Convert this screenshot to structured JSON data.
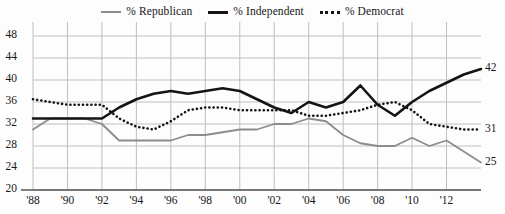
{
  "legend": {
    "position": "top-center",
    "entries": [
      {
        "label": "% Republican",
        "key": "republican",
        "marker": "solid-gray-line-icon",
        "color": "#8c8c8c"
      },
      {
        "label": "% Independent",
        "key": "independent",
        "marker": "solid-black-line-icon",
        "color": "#141414"
      },
      {
        "label": "% Democrat",
        "key": "democrat",
        "marker": "dotted-black-line-icon",
        "color": "#141414"
      }
    ]
  },
  "chart_data": {
    "type": "line",
    "title": "",
    "subtitle": "",
    "xlabel": "",
    "ylabel": "",
    "xlim": [
      1988,
      2014
    ],
    "ylim": [
      20,
      48
    ],
    "ytick_step": 4,
    "yticks": [
      20,
      24,
      28,
      32,
      36,
      40,
      44,
      48
    ],
    "xticks": [
      1988,
      1990,
      1992,
      1994,
      1996,
      1998,
      2000,
      2002,
      2004,
      2006,
      2008,
      2010,
      2012
    ],
    "xtick_labels": [
      "'88",
      "'90",
      "'92",
      "'94",
      "'96",
      "'98",
      "'00",
      "'02",
      "'04",
      "'06",
      "'08",
      "'10",
      "'12"
    ],
    "grid": true,
    "grid_color": "#bfbfbf",
    "x": [
      1988,
      1989,
      1990,
      1991,
      1992,
      1993,
      1994,
      1995,
      1996,
      1997,
      1998,
      1999,
      2000,
      2001,
      2002,
      2003,
      2004,
      2005,
      2006,
      2007,
      2008,
      2009,
      2010,
      2011,
      2012,
      2013,
      2014
    ],
    "series": [
      {
        "name": "% Republican",
        "key": "republican",
        "color": "#8c8c8c",
        "style": "solid",
        "width": 1.8,
        "end_label": "25",
        "values": [
          31,
          33,
          33,
          33,
          32,
          29,
          29,
          29,
          29,
          30,
          30,
          30.5,
          31,
          31,
          32,
          32,
          33,
          32.5,
          30,
          28.5,
          28,
          28,
          29.5,
          28,
          29,
          27,
          25
        ]
      },
      {
        "name": "% Independent",
        "key": "independent",
        "color": "#141414",
        "style": "solid",
        "width": 2.6,
        "end_label": "42",
        "values": [
          33,
          33,
          33,
          33,
          33,
          35,
          36.5,
          37.5,
          38,
          37.5,
          38,
          38.5,
          38,
          36.5,
          35,
          34,
          36,
          35,
          36,
          39,
          35.5,
          33.5,
          36,
          38,
          39.5,
          41,
          42
        ]
      },
      {
        "name": "% Democrat",
        "key": "democrat",
        "color": "#141414",
        "style": "dotted",
        "width": 2.6,
        "end_label": "31",
        "values": [
          36.5,
          36,
          35.5,
          35.5,
          35.5,
          33,
          31.5,
          31,
          32.5,
          34.5,
          35,
          35,
          34.5,
          34.5,
          34.5,
          34.5,
          33.5,
          33.5,
          34,
          34.5,
          35.5,
          36,
          34.5,
          32,
          31.5,
          31,
          31
        ]
      }
    ]
  }
}
